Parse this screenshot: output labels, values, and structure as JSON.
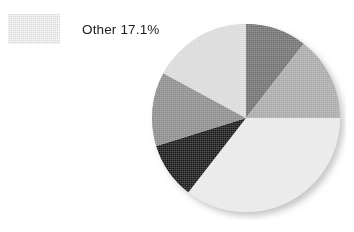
{
  "figure": {
    "background_color": "#ffffff"
  },
  "legend": {
    "position": "top-left",
    "entries": [
      {
        "label": "Other 17.1%",
        "name": "Other",
        "value": 17.1,
        "color": "#d9d9d9",
        "swatch_name": "legend-swatch-other"
      }
    ]
  },
  "chart_data": {
    "type": "pie",
    "title": "",
    "subtitle": "",
    "xlabel": "",
    "ylabel": "",
    "grid": false,
    "legend_position": "top-left",
    "start_angle_deg": 0,
    "direction": "clockwise",
    "units": "percent",
    "labels": [
      "Slice 1",
      "Slice 2",
      "Slice 3",
      "Slice 4",
      "Slice 5",
      "Other"
    ],
    "values": [
      10.5,
      14.5,
      35.5,
      9.7,
      12.7,
      17.1
    ],
    "colors": [
      "#6e6e6e",
      "#a8a8a8",
      "#e8e8e8",
      "#141414",
      "#8a8a8a",
      "#d9d9d9"
    ],
    "annotations": [
      {
        "text": "Other 17.1%",
        "target_slice": "Other",
        "placement": "legend"
      }
    ],
    "center": {
      "x": 96,
      "y": 98
    },
    "radius": 94,
    "has_drop_shadow": true
  }
}
